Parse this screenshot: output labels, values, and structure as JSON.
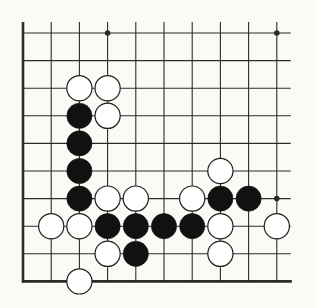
{
  "diagram": {
    "type": "go-board-diagram",
    "board_section": "bottom-left corner, 10 columns x 10 rows",
    "colors": {
      "background": "#fbfbf6",
      "line": "#2b2b2b",
      "black_stone": "#111111",
      "white_stone_fill": "#ffffff",
      "white_stone_edge": "#1e1e1e"
    },
    "grid": {
      "columns": 10,
      "rows": 10,
      "origin_x": 23,
      "origin_y": 33,
      "spacing_x": 28.2,
      "spacing_y": 27.6,
      "line_extension_right": 14,
      "line_extension_top": 11,
      "thick_edges": [
        "left",
        "bottom"
      ],
      "stone_radius": 12.6
    },
    "star_points": [
      {
        "col": 3,
        "row": 0
      },
      {
        "col": 9,
        "row": 0
      },
      {
        "col": 9,
        "row": 6
      }
    ],
    "stones": [
      {
        "color": "white",
        "col": 2,
        "row": 2
      },
      {
        "color": "white",
        "col": 3,
        "row": 2
      },
      {
        "color": "black",
        "col": 2,
        "row": 3
      },
      {
        "color": "white",
        "col": 3,
        "row": 3
      },
      {
        "color": "black",
        "col": 2,
        "row": 4
      },
      {
        "color": "black",
        "col": 2,
        "row": 5
      },
      {
        "color": "white",
        "col": 7,
        "row": 5
      },
      {
        "color": "black",
        "col": 2,
        "row": 6
      },
      {
        "color": "white",
        "col": 3,
        "row": 6
      },
      {
        "color": "white",
        "col": 4,
        "row": 6
      },
      {
        "color": "white",
        "col": 6,
        "row": 6
      },
      {
        "color": "black",
        "col": 7,
        "row": 6
      },
      {
        "color": "black",
        "col": 8,
        "row": 6
      },
      {
        "color": "white",
        "col": 1,
        "row": 7
      },
      {
        "color": "white",
        "col": 2,
        "row": 7
      },
      {
        "color": "black",
        "col": 3,
        "row": 7
      },
      {
        "color": "black",
        "col": 4,
        "row": 7
      },
      {
        "color": "black",
        "col": 5,
        "row": 7
      },
      {
        "color": "black",
        "col": 6,
        "row": 7
      },
      {
        "color": "white",
        "col": 7,
        "row": 7
      },
      {
        "color": "white",
        "col": 9,
        "row": 7
      },
      {
        "color": "white",
        "col": 3,
        "row": 8
      },
      {
        "color": "black",
        "col": 4,
        "row": 8
      },
      {
        "color": "white",
        "col": 7,
        "row": 8
      },
      {
        "color": "white",
        "col": 2,
        "row": 9
      }
    ],
    "stone_counts": {
      "black": 11,
      "white": 14
    }
  }
}
